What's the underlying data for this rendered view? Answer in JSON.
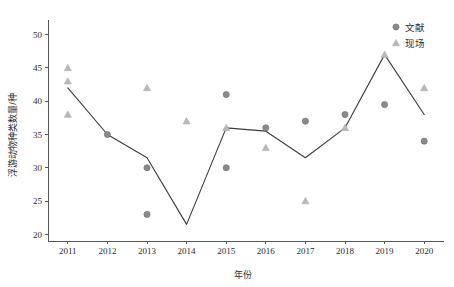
{
  "chart_data": {
    "type": "scatter",
    "title": "",
    "xlabel": "年份",
    "ylabel": "浮游动物种类数量/种",
    "xlim": [
      2010.5,
      2020.5
    ],
    "ylim": [
      19,
      51
    ],
    "xticks": [
      "2011",
      "2012",
      "2013",
      "2014",
      "2015",
      "2016",
      "2017",
      "2018",
      "2019",
      "2020"
    ],
    "yticks": [
      "20",
      "25",
      "30",
      "35",
      "40",
      "45",
      "50"
    ],
    "grid": false,
    "legend_position": "top-right",
    "legend": [
      {
        "label": "文献",
        "marker": "circle",
        "color": "#8a8a8a"
      },
      {
        "label": "现场",
        "marker": "triangle",
        "color": "#b9b9b9"
      }
    ],
    "series": [
      {
        "name": "文献",
        "marker": "circle",
        "color": "#8a8a8a",
        "points": [
          {
            "x": 2012,
            "y": 35
          },
          {
            "x": 2013,
            "y": 30
          },
          {
            "x": 2013,
            "y": 23
          },
          {
            "x": 2015,
            "y": 41
          },
          {
            "x": 2015,
            "y": 30
          },
          {
            "x": 2016,
            "y": 36
          },
          {
            "x": 2017,
            "y": 37
          },
          {
            "x": 2018,
            "y": 38
          },
          {
            "x": 2019,
            "y": 39.5
          },
          {
            "x": 2020,
            "y": 34
          }
        ]
      },
      {
        "name": "现场",
        "marker": "triangle",
        "color": "#b9b9b9",
        "points": [
          {
            "x": 2011,
            "y": 45
          },
          {
            "x": 2011,
            "y": 43
          },
          {
            "x": 2011,
            "y": 38
          },
          {
            "x": 2013,
            "y": 42
          },
          {
            "x": 2014,
            "y": 37
          },
          {
            "x": 2015,
            "y": 36
          },
          {
            "x": 2016,
            "y": 33
          },
          {
            "x": 2017,
            "y": 25
          },
          {
            "x": 2018,
            "y": 36
          },
          {
            "x": 2019,
            "y": 47
          },
          {
            "x": 2020,
            "y": 42
          }
        ]
      },
      {
        "name": "趋势线",
        "marker": "none",
        "color": "#3b3b3b",
        "points": [
          {
            "x": 2011,
            "y": 42
          },
          {
            "x": 2012,
            "y": 35
          },
          {
            "x": 2013,
            "y": 31.5
          },
          {
            "x": 2014,
            "y": 21.5
          },
          {
            "x": 2015,
            "y": 36
          },
          {
            "x": 2016,
            "y": 35.5
          },
          {
            "x": 2017,
            "y": 31.5
          },
          {
            "x": 2018,
            "y": 36
          },
          {
            "x": 2019,
            "y": 47
          },
          {
            "x": 2020,
            "y": 38
          }
        ]
      }
    ]
  }
}
